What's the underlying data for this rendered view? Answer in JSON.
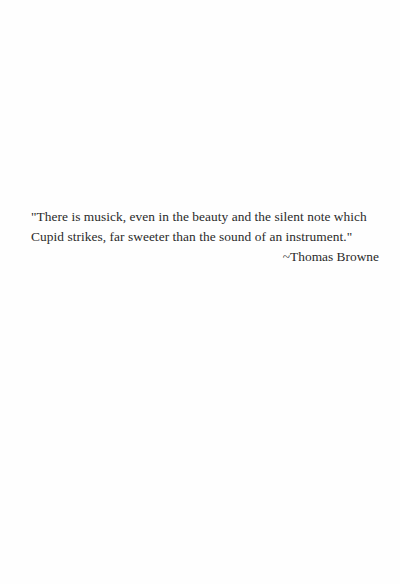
{
  "quote": {
    "lines": [
      "\"There is musick, even in the beauty and the silent note which",
      "Cupid strikes, far sweeter than the sound of an instrument.\""
    ],
    "attribution": "~Thomas Browne"
  },
  "colors": {
    "background": "#fefefe",
    "text": "#2a2a2a"
  }
}
